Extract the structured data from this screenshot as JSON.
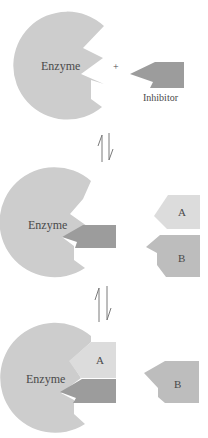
{
  "figure": {
    "colors": {
      "background": "#ffffff",
      "enzyme": "#cdcdcd",
      "inhibitor": "#9c9c9c",
      "substrate_a": "#dcdcdc",
      "substrate_b": "#bdbdbd",
      "text": "#4a4a4a",
      "arrow": "#7a7a7a"
    },
    "stage1": {
      "enzyme_label": "Enzyme",
      "plus_sign": "+",
      "inhibitor_label": "Inhibitor"
    },
    "arrows": [
      {
        "name": "equilibrium-1",
        "glyph": "⇅"
      },
      {
        "name": "equilibrium-2",
        "glyph": "⇅"
      }
    ],
    "stage2": {
      "enzyme_label": "Enzyme",
      "free_a_label": "A",
      "free_b_label": "B"
    },
    "stage3": {
      "enzyme_label": "Enzyme",
      "bound_a_label": "A",
      "free_b_label": "B"
    }
  }
}
